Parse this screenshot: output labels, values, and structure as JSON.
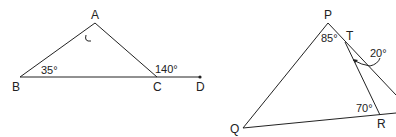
{
  "figures": [
    {
      "name": "triangle-abc",
      "points": {
        "A": "A",
        "B": "B",
        "C": "C",
        "D": "D"
      },
      "angles": {
        "B": "35°",
        "exterior_C": "140°",
        "A": "unknown"
      }
    },
    {
      "name": "triangle-pqr",
      "points": {
        "P": "P",
        "Q": "Q",
        "R": "R",
        "T": "T"
      },
      "angles": {
        "P": "85°",
        "R": "70°",
        "T": "20°"
      }
    }
  ]
}
